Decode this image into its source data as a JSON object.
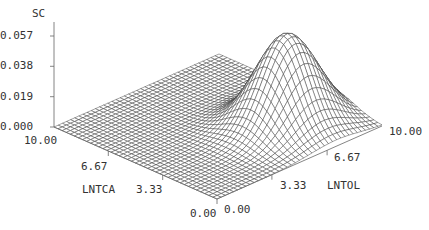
{
  "chart_data": {
    "type": "surface3d",
    "title": "",
    "zlabel": "SC",
    "xlabel": "LNTOL",
    "ylabel": "LNTCA",
    "zticks": [
      "0.000",
      "0.019",
      "0.038",
      "0.057"
    ],
    "xticks": [
      "0.00",
      "3.33",
      "6.67",
      "10.00"
    ],
    "yticks": [
      "0.00",
      "3.33",
      "6.67",
      "10.00"
    ],
    "xlim": [
      0,
      10
    ],
    "ylim": [
      0,
      10
    ],
    "zlim": [
      0,
      0.057
    ],
    "grid_n": 40,
    "surface": {
      "form": "gaussian_bump",
      "peak_x_LNTOL": 7.2,
      "peak_y_LNTCA": 3.0,
      "peak_z": 0.057,
      "sigma_x": 1.5,
      "sigma_y": 1.3
    },
    "line_color": "#333333"
  },
  "axes": {
    "z_label": "SC",
    "z_ticks": [
      {
        "label": "0.057",
        "value": 0.057
      },
      {
        "label": "0.038",
        "value": 0.038
      },
      {
        "label": "0.019",
        "value": 0.019
      },
      {
        "label": "0.000",
        "value": 0.0
      }
    ],
    "lntca_label": "LNTCA",
    "lntca_ticks": [
      {
        "label": "10.00",
        "value": 10
      },
      {
        "label": "6.67",
        "value": 6.67
      },
      {
        "label": "3.33",
        "value": 3.33
      },
      {
        "label": "0.00",
        "value": 0
      }
    ],
    "lntol_label": "LNTOL",
    "lntol_ticks": [
      {
        "label": "0.00",
        "value": 0
      },
      {
        "label": "3.33",
        "value": 3.33
      },
      {
        "label": "6.67",
        "value": 6.67
      },
      {
        "label": "10.00",
        "value": 10
      }
    ]
  }
}
